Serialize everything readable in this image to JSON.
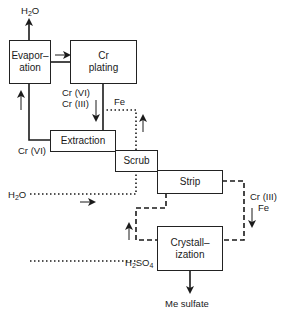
{
  "diagram": {
    "type": "process-flow",
    "boxes": {
      "evaporation": {
        "line1": "Evapor–",
        "line2": "ation"
      },
      "cr_plating": {
        "line1": "Cr",
        "line2": "plating"
      },
      "extraction": {
        "label": "Extraction"
      },
      "scrub": {
        "label": "Scrub"
      },
      "strip": {
        "label": "Strip"
      },
      "crystallization": {
        "line1": "Crystall–",
        "line2": "ization"
      }
    },
    "labels": {
      "h2o_top": {
        "pre": "H",
        "sub": "2",
        "post": "O"
      },
      "cr_vi_cr_iii": {
        "line1": "Cr (VI)",
        "line2": "Cr (III)"
      },
      "fe_top": "Fe",
      "cr_vi_left": "Cr (VI)",
      "h2o_left": {
        "pre": "H",
        "sub": "2",
        "post": "O"
      },
      "cr_iii_fe": {
        "line1": "Cr (III)",
        "line2": "Fe"
      },
      "h2so4": {
        "pre": "H",
        "sub1": "2",
        "mid": "SO",
        "sub2": "4"
      },
      "me_sulfate": "Me sulfate"
    },
    "line_styles": {
      "solid": "Cr(VI) loop",
      "dotted": "H2O scrub / Fe",
      "dashed": "H2SO4 strip / crystallization loop"
    },
    "color": "#1a1a1a"
  }
}
